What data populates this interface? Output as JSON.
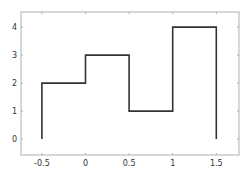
{
  "chart_data": {
    "type": "line",
    "style": "stairs",
    "title": "",
    "xlabel": "",
    "ylabel": "",
    "x": [
      -0.5,
      0,
      0.5,
      1,
      1.5
    ],
    "path": [
      [
        -0.5,
        0
      ],
      [
        -0.5,
        2
      ],
      [
        0,
        2
      ],
      [
        0,
        3
      ],
      [
        0.5,
        3
      ],
      [
        0.5,
        1
      ],
      [
        1,
        1
      ],
      [
        1,
        4
      ],
      [
        1.5,
        4
      ],
      [
        1.5,
        0
      ]
    ],
    "series": [
      {
        "name": "stairs",
        "x": [
          -0.5,
          0,
          0.5,
          1,
          1.5
        ],
        "values": [
          2,
          3,
          1,
          4,
          0
        ]
      }
    ],
    "xlim": [
      -0.74,
      1.76
    ],
    "ylim": [
      -0.57,
      4.54
    ],
    "xticks": [
      -0.5,
      0,
      0.5,
      1,
      1.5
    ],
    "xtick_labels": [
      "-0.5",
      "0",
      "0.5",
      "1",
      "1.5"
    ],
    "yticks": [
      0,
      1,
      2,
      3,
      4
    ],
    "ytick_labels": [
      "0",
      "1",
      "2",
      "3",
      "4"
    ],
    "grid": false,
    "legend": null,
    "line_color": "#333333",
    "axis_color": "#b0b0b0"
  }
}
